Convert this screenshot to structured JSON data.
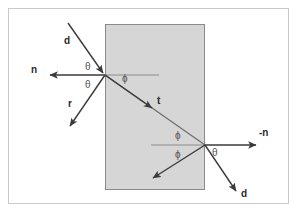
{
  "figure": {
    "background_color": "#ffffff",
    "border_color": "#c9c9c9",
    "slab_fill_color": "#d6d6d6",
    "slab_stroke_color": "#8a8a8a",
    "ray_color": "#3a3a3a",
    "normal_color": "#555555"
  },
  "slab": {
    "label": "glass-slab",
    "x": 105,
    "y": 24,
    "width": 100,
    "height": 166
  },
  "points": {
    "entry": {
      "x": 105,
      "y": 75
    },
    "exit": {
      "x": 205,
      "y": 145
    }
  },
  "rays": [
    {
      "name": "incident-ray",
      "label": "d",
      "x1": 68,
      "y1": 23,
      "x2": 105,
      "y2": 75,
      "label_x": 66,
      "label_y": 37
    },
    {
      "name": "incident-normal-ray",
      "label": "n",
      "x1": 105,
      "y1": 75,
      "x2": 48,
      "y2": 75,
      "label_x": 32,
      "label_y": 66
    },
    {
      "name": "reflected-ray",
      "label": "r",
      "x1": 105,
      "y1": 75,
      "x2": 68,
      "y2": 129,
      "label_x": 69,
      "label_y": 100
    },
    {
      "name": "transmitted-ray",
      "label": "t",
      "x1": 105,
      "y1": 75,
      "x2": 205,
      "y2": 145,
      "label_x": 158,
      "label_y": 98
    },
    {
      "name": "exit-normal-ray",
      "label": "-n",
      "x1": 205,
      "y1": 145,
      "x2": 259,
      "y2": 145,
      "label_x": 262,
      "label_y": 130
    },
    {
      "name": "exit-ray",
      "label": "d",
      "x1": 205,
      "y1": 145,
      "x2": 238,
      "y2": 194,
      "label_x": 243,
      "label_y": 190
    },
    {
      "name": "internal-reflected-ray",
      "label": "",
      "x1": 205,
      "y1": 145,
      "x2": 151,
      "y2": 180,
      "label_x": 0,
      "label_y": 0
    }
  ],
  "normals": [
    {
      "name": "entry-interface-normal-line",
      "x1": 105,
      "y1": 75,
      "x2": 159,
      "y2": 75
    },
    {
      "name": "exit-interface-normal-line",
      "x1": 151,
      "y1": 145,
      "x2": 205,
      "y2": 145
    }
  ],
  "angle_labels": [
    {
      "name": "theta-incident",
      "text": "θ",
      "x": 86,
      "y": 62
    },
    {
      "name": "theta-reflected",
      "text": "θ",
      "x": 86,
      "y": 80
    },
    {
      "name": "phi-refracted-entry",
      "text": "ϕ",
      "x": 123,
      "y": 74
    },
    {
      "name": "phi-incident-exit",
      "text": "ϕ",
      "x": 176,
      "y": 131
    },
    {
      "name": "phi-internal-reflected",
      "text": "ϕ",
      "x": 176,
      "y": 150
    },
    {
      "name": "theta-exit",
      "text": "θ",
      "x": 213,
      "y": 148
    }
  ]
}
